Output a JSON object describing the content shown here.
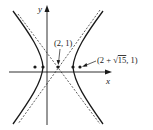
{
  "diagram": {
    "axes": {
      "x_label": "x",
      "y_label": "y"
    },
    "labels": {
      "center": "(2, 1)",
      "focus_prefix": "(2 + ",
      "focus_radicand": "15",
      "focus_suffix": ", 1)"
    },
    "points": [
      {
        "name": "left-focus",
        "px": 35
      },
      {
        "name": "left-vertex",
        "px": 43
      },
      {
        "name": "center",
        "px": 58
      },
      {
        "name": "right-vertex",
        "px": 73
      },
      {
        "name": "right-focus",
        "px": 80
      }
    ],
    "colors": {
      "stroke": "#1a1a1a",
      "background": "#ffffff"
    }
  }
}
